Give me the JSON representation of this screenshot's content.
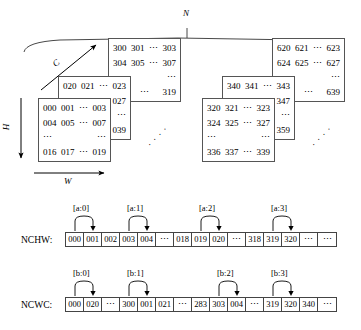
{
  "diagram": {
    "title_axis_n": "N",
    "axis_c": "C",
    "axis_h": "H",
    "axis_w": "W",
    "ellipsis": "⋯",
    "vdots": "⋯",
    "groups": [
      {
        "name": "batch-0",
        "planes": [
          {
            "name": "plane-n0-c2",
            "rows": [
              [
                "300",
                "301",
                "⋯",
                "303"
              ],
              [
                "304",
                "305",
                "⋯",
                "307"
              ],
              [
                "⋯",
                "",
                "",
                "⋯"
              ],
              [
                "317",
                "",
                "⋯",
                "319"
              ]
            ]
          },
          {
            "name": "plane-n0-c1",
            "rows": [
              [
                "020",
                "021",
                "⋯",
                "023"
              ],
              [
                "",
                "",
                "",
                "027"
              ],
              [
                "",
                "",
                "",
                "⋯"
              ],
              [
                "",
                "",
                "",
                "039"
              ]
            ]
          },
          {
            "name": "plane-n0-c0",
            "rows": [
              [
                "000",
                "001",
                "⋯",
                "003"
              ],
              [
                "004",
                "005",
                "⋯",
                "007"
              ],
              [
                "⋯",
                "",
                "",
                "⋯"
              ],
              [
                "016",
                "017",
                "⋯",
                "019"
              ]
            ]
          }
        ]
      },
      {
        "name": "batch-n",
        "planes": [
          {
            "name": "plane-nN-c2",
            "rows": [
              [
                "620",
                "621",
                "⋯",
                "623"
              ],
              [
                "624",
                "625",
                "⋯",
                "627"
              ],
              [
                "⋯",
                "",
                "",
                "⋯"
              ],
              [
                "637",
                "",
                "⋯",
                "639"
              ]
            ]
          },
          {
            "name": "plane-nN-c1",
            "rows": [
              [
                "340",
                "341",
                "⋯",
                "343"
              ],
              [
                "",
                "",
                "",
                "347"
              ],
              [
                "",
                "",
                "",
                "⋯"
              ],
              [
                "",
                "",
                "",
                "359"
              ]
            ]
          },
          {
            "name": "plane-nN-c0",
            "rows": [
              [
                "320",
                "321",
                "⋯",
                "323"
              ],
              [
                "324",
                "325",
                "⋯",
                "327"
              ],
              [
                "⋯",
                "",
                "",
                "⋯"
              ],
              [
                "336",
                "337",
                "⋯",
                "339"
              ]
            ]
          }
        ]
      }
    ]
  },
  "layouts": [
    {
      "id": "nchw",
      "label": "NCHW:",
      "cells": [
        "000",
        "001",
        "002",
        "003",
        "004",
        "⋯",
        "018",
        "019",
        "020",
        "⋯",
        "318",
        "319",
        "320",
        "⋯",
        "⋯"
      ],
      "annotations": [
        {
          "label": "[a:0]",
          "from": 0,
          "to": 1
        },
        {
          "label": "[a:1]",
          "from": 3,
          "to": 4
        },
        {
          "label": "[a:2]",
          "from": 7,
          "to": 8
        },
        {
          "label": "[a:3]",
          "from": 11,
          "to": 12
        }
      ]
    },
    {
      "id": "ncwc",
      "label": "NCWC:",
      "cells": [
        "000",
        "020",
        "⋯",
        "300",
        "001",
        "021",
        "⋯",
        "283",
        "303",
        "004",
        "⋯",
        "319",
        "320",
        "340",
        "⋯"
      ],
      "annotations": [
        {
          "label": "[b:0]",
          "from": 0,
          "to": 1
        },
        {
          "label": "[b:1]",
          "from": 3,
          "to": 4
        },
        {
          "label": "[b:2]",
          "from": 8,
          "to": 9
        },
        {
          "label": "[b:3]",
          "from": 11,
          "to": 12
        }
      ]
    }
  ]
}
